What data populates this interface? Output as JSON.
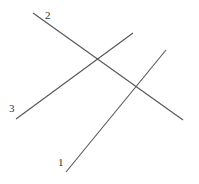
{
  "diagram": {
    "line_color": "#555555",
    "label_color": "#333333",
    "background": "#ffffff",
    "lines": [
      {
        "id": "line-1",
        "label": "1",
        "x1": 66,
        "y1": 172,
        "x2": 166,
        "y2": 50,
        "label_x": 58,
        "label_y": 166
      },
      {
        "id": "line-2",
        "label": "2",
        "x1": 33,
        "y1": 13,
        "x2": 183,
        "y2": 120,
        "label_x": 45,
        "label_y": 19
      },
      {
        "id": "line-3",
        "label": "3",
        "x1": 16,
        "y1": 119,
        "x2": 133,
        "y2": 33,
        "label_x": 9,
        "label_y": 112
      }
    ]
  }
}
